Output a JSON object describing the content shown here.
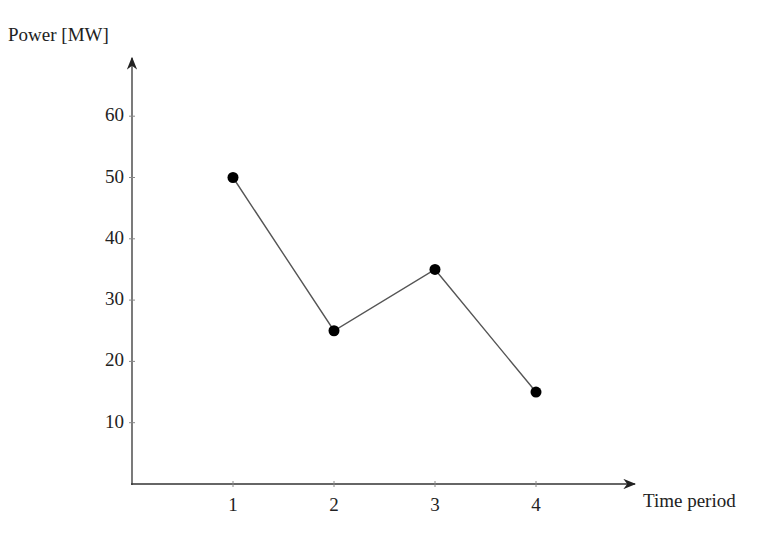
{
  "chart_data": {
    "type": "line",
    "title": "",
    "xlabel": "Time period",
    "ylabel": "Power [MW]",
    "x": [
      1,
      2,
      3,
      4
    ],
    "categories": [
      "1",
      "2",
      "3",
      "4"
    ],
    "values": [
      50,
      25,
      35,
      15
    ],
    "series": [
      {
        "name": "Power",
        "values": [
          50,
          25,
          35,
          15
        ],
        "marker": "filled-circle",
        "color": "#000000"
      }
    ],
    "xticks": [
      "1",
      "2",
      "3",
      "4"
    ],
    "yticks": [
      "10",
      "20",
      "30",
      "40",
      "50",
      "60"
    ],
    "xlim": [
      0,
      5
    ],
    "ylim": [
      0,
      68
    ],
    "grid": false,
    "legend": null
  },
  "axes": {
    "ylabel": "Power [MW]",
    "xlabel": "Time period",
    "yticks": [
      "10",
      "20",
      "30",
      "40",
      "50",
      "60"
    ],
    "xticks": [
      "1",
      "2",
      "3",
      "4"
    ]
  }
}
